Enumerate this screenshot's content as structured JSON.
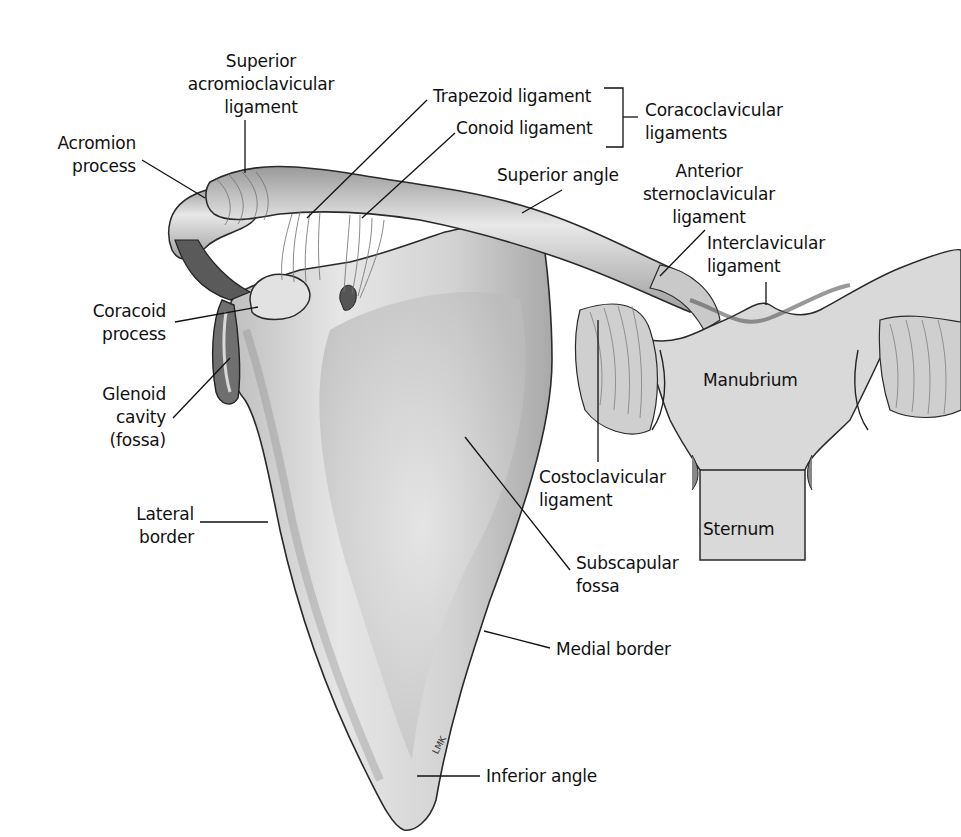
{
  "figure": {
    "artist_signature": "LMK",
    "colors": {
      "bone": "#d9d9d9",
      "bone_shadow": "#8a8a8a",
      "outline": "#2a2a2a",
      "label": "#111111",
      "background": "#ffffff"
    }
  },
  "labels": {
    "superior_acromioclavicular": {
      "line1": "Superior",
      "line2": "acromioclavicular",
      "line3": "ligament"
    },
    "acromion_process": {
      "line1": "Acromion",
      "line2": "process"
    },
    "trapezoid_ligament": {
      "line1": "Trapezoid ligament"
    },
    "conoid_ligament": {
      "line1": "Conoid ligament"
    },
    "coracoclavicular_ligaments": {
      "line1": "Coracoclavicular",
      "line2": "ligaments"
    },
    "superior_angle": {
      "line1": "Superior angle"
    },
    "anterior_sternoclavicular": {
      "line1": "Anterior",
      "line2": "sternoclavicular",
      "line3": "ligament"
    },
    "interclavicular_ligament": {
      "line1": "Interclavicular",
      "line2": "ligament"
    },
    "coracoid_process": {
      "line1": "Coracoid",
      "line2": "process"
    },
    "glenoid_cavity": {
      "line1": "Glenoid",
      "line2": "cavity",
      "line3": "(fossa)"
    },
    "manubrium": {
      "line1": "Manubrium"
    },
    "costoclavicular_ligament": {
      "line1": "Costoclavicular",
      "line2": "ligament"
    },
    "sternum": {
      "line1": "Sternum"
    },
    "lateral_border": {
      "line1": "Lateral",
      "line2": "border"
    },
    "subscapular_fossa": {
      "line1": "Subscapular",
      "line2": "fossa"
    },
    "medial_border": {
      "line1": "Medial border"
    },
    "inferior_angle": {
      "line1": "Inferior angle"
    }
  }
}
